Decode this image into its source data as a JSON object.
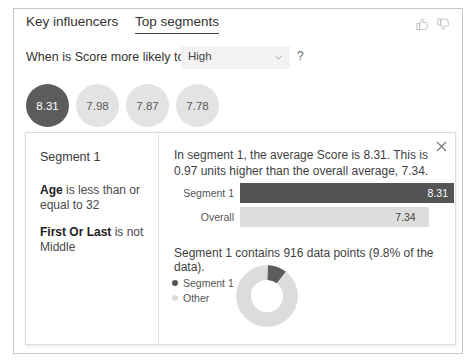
{
  "tabs": [
    {
      "label": "Key influencers",
      "selected": false
    },
    {
      "label": "Top segments",
      "selected": true
    }
  ],
  "header_icons": {
    "thumbs_up": "thumbs-up-icon",
    "thumbs_down": "thumbs-down-icon"
  },
  "question": {
    "label": "When is Score more likely to be",
    "select_value": "High",
    "select_options": [
      "High"
    ],
    "help": "?"
  },
  "bubbles": [
    {
      "value": "8.31",
      "selected": true
    },
    {
      "value": "7.98",
      "selected": false
    },
    {
      "value": "7.87",
      "selected": false
    },
    {
      "value": "7.78",
      "selected": false
    }
  ],
  "detail": {
    "close": "✕",
    "segment_title": "Segment 1",
    "rules": [
      {
        "field": "Age",
        "text": " is less than or equal to 32"
      },
      {
        "field": "First Or Last",
        "text": " is not Middle"
      }
    ],
    "summary": "In segment 1, the average Score is 8.31. This is 0.97 units higher than the overall average, 7.34.",
    "count_text": "Segment 1 contains 916 data points (9.8% of the data)."
  },
  "chart_data": [
    {
      "type": "bar",
      "title": "",
      "orientation": "horizontal",
      "categories": [
        "Segment 1",
        "Overall"
      ],
      "values": [
        8.31,
        7.34
      ],
      "value_labels": [
        "8.31",
        "7.34"
      ],
      "colors": [
        "#545454",
        "#dddddd"
      ],
      "xlabel": "",
      "ylabel": "",
      "xlim": [
        0,
        8.31
      ],
      "grid": false,
      "legend": "none"
    },
    {
      "type": "pie",
      "subtype": "donut",
      "title": "",
      "categories": [
        "Segment 1",
        "Other"
      ],
      "values": [
        9.8,
        90.2
      ],
      "unit": "percent",
      "colors": [
        "#5c5c5c",
        "#dcdcdc"
      ],
      "legend": "left"
    }
  ],
  "colors": {
    "selected_bubble": "#5c5c5c",
    "unselected_bubble": "#e3e3e3",
    "primary_bar": "#545454",
    "secondary_bar": "#dddddd",
    "border": "#c8c8c8"
  }
}
